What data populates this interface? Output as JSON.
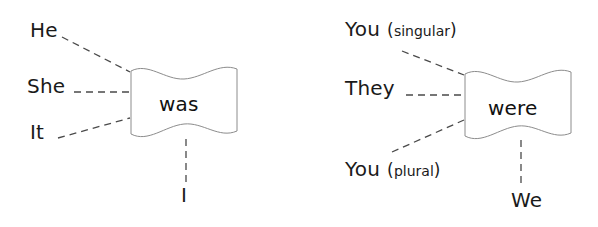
{
  "diagram": {
    "type": "pronoun-verb-agreement",
    "colors": {
      "background": "#ffffff",
      "text": "#1a1a1a",
      "flag_outline": "#8c8c8c",
      "connector": "#4a4a4a"
    },
    "groups": [
      {
        "verb": "was",
        "subjects": [
          "He",
          "She",
          "It",
          "I"
        ]
      },
      {
        "verb": "were",
        "subjects": [
          "You ( singular )",
          "They",
          "You ( plural )",
          "We"
        ]
      }
    ]
  },
  "left": {
    "verb": "was",
    "he": "He",
    "she": "She",
    "it": "It",
    "i": "I"
  },
  "right": {
    "verb": "were",
    "you_singular": {
      "pronoun": "You",
      "open_paren": "(",
      "qualifier": "singular",
      "close_paren": ")"
    },
    "they": "They",
    "you_plural": {
      "pronoun": "You",
      "open_paren": "(",
      "qualifier": "plural",
      "close_paren": ")"
    },
    "we": "We"
  }
}
